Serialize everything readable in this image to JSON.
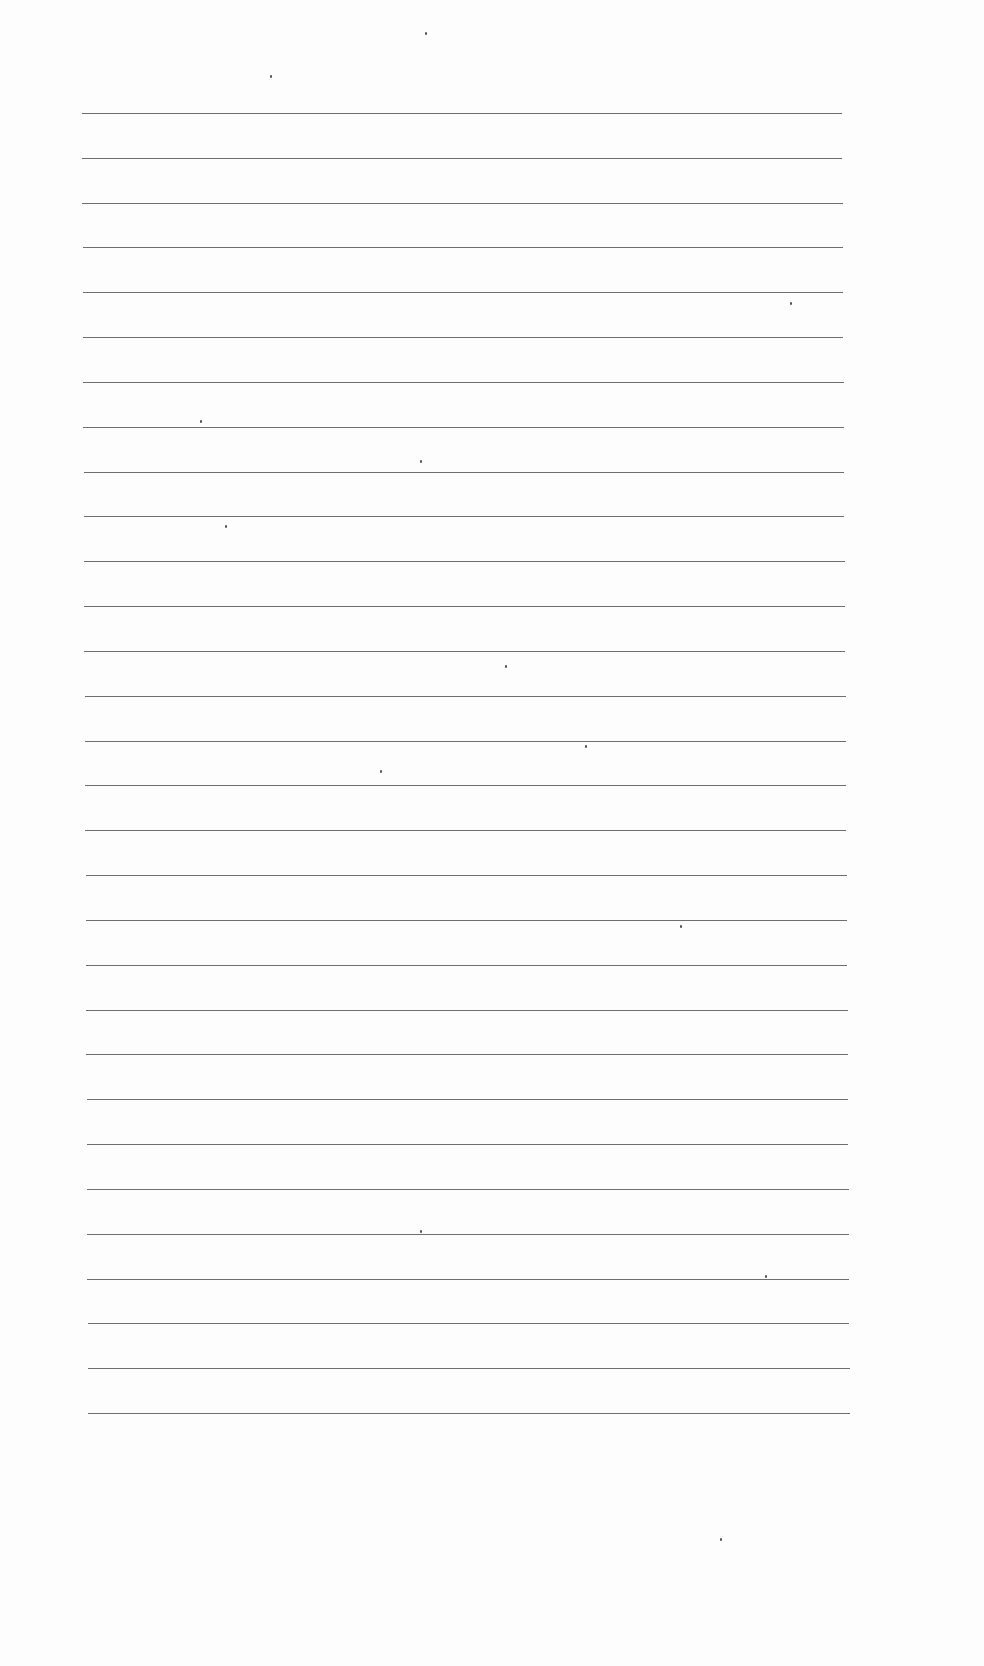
{
  "page": {
    "type": "blank lined paper",
    "line_count": 30,
    "line_color": "#6e6e6e",
    "background": "#fdfdfd",
    "text": ""
  }
}
